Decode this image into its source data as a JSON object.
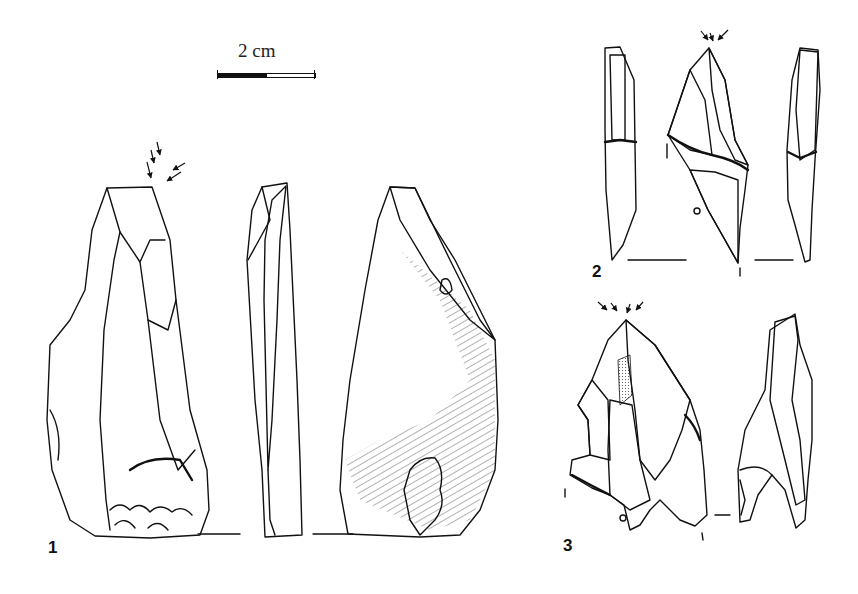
{
  "figure": {
    "scale_bar": {
      "label": "2 cm",
      "segments": [
        "black",
        "white"
      ]
    },
    "artifacts": [
      {
        "number": "1",
        "views": [
          "dorsal",
          "lateral",
          "ventral"
        ],
        "burin_blow_arrows": 5
      },
      {
        "number": "2",
        "views": [
          "lateral-left",
          "dorsal",
          "lateral-right"
        ],
        "burin_blow_arrows": 3
      },
      {
        "number": "3",
        "views": [
          "dorsal",
          "lateral"
        ],
        "burin_blow_arrows": 4
      }
    ],
    "colors": {
      "ink": "#111111",
      "background": "#ffffff"
    }
  }
}
